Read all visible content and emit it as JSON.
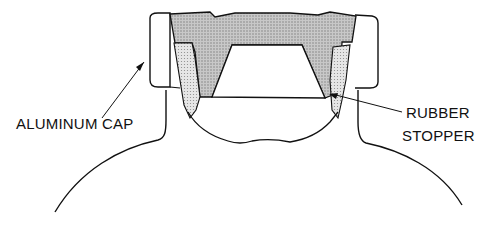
{
  "diagram": {
    "labels": {
      "aluminum_cap": "ALUMINUM CAP",
      "rubber_stopper_line1": "RUBBER",
      "rubber_stopper_line2": "STOPPER"
    },
    "colors": {
      "stroke": "#111111",
      "stopper_fill": "#b8b8b8",
      "stopper_side_fill": "#d4d4d4",
      "background": "#ffffff"
    }
  }
}
